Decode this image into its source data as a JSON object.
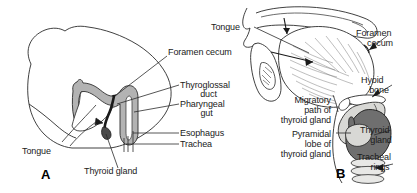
{
  "figure": {
    "panels": [
      {
        "id": "A",
        "letter": "A",
        "caption": "Sagittal section of embryonic head showing thyroglossal duct",
        "labels": [
          {
            "name": "foramen-cecum",
            "text": "Foramen cecum"
          },
          {
            "name": "thyroglossal-duct-line1",
            "text": "Thyroglossal"
          },
          {
            "name": "thyroglossal-duct-line2",
            "text": "duct"
          },
          {
            "name": "pharyngeal-gut-line1",
            "text": "Pharyngeal"
          },
          {
            "name": "pharyngeal-gut-line2",
            "text": "gut"
          },
          {
            "name": "esophagus",
            "text": "Esophagus"
          },
          {
            "name": "trachea",
            "text": "Trachea"
          },
          {
            "name": "tongue",
            "text": "Tongue"
          },
          {
            "name": "thyroid-gland",
            "text": "Thyroid gland"
          }
        ]
      },
      {
        "id": "B",
        "letter": "B",
        "caption": "Sagittal section of adult head and neck showing migratory path of thyroid gland",
        "labels": [
          {
            "name": "tongue",
            "text": "Tongue"
          },
          {
            "name": "foramen-cecum-line1",
            "text": "Foramen"
          },
          {
            "name": "foramen-cecum-line2",
            "text": "cecum"
          },
          {
            "name": "hyoid-bone-line1",
            "text": "Hyoid"
          },
          {
            "name": "hyoid-bone-line2",
            "text": "bone"
          },
          {
            "name": "migratory-path-line1",
            "text": "Migratory"
          },
          {
            "name": "migratory-path-line2",
            "text": "path of"
          },
          {
            "name": "migratory-path-line3",
            "text": "thyroid gland"
          },
          {
            "name": "pyramidal-lobe-line1",
            "text": "Pyramidal"
          },
          {
            "name": "pyramidal-lobe-line2",
            "text": "lobe of"
          },
          {
            "name": "pyramidal-lobe-line3",
            "text": "thyroid gland"
          },
          {
            "name": "thyroid-gland-line1",
            "text": "Thyroid"
          },
          {
            "name": "thyroid-gland-line2",
            "text": "gland"
          },
          {
            "name": "tracheal-rings-line1",
            "text": "Tracheal"
          },
          {
            "name": "tracheal-rings-line2",
            "text": "rings"
          }
        ]
      }
    ]
  },
  "colors": {
    "background": "#ffffff",
    "ink": "#1a1a1a",
    "outline": "#2b2b2b",
    "duct_fill": "#b3b3b3",
    "cartilage_fill": "#d8d8d5",
    "thyroid_fill": "#6f6f6f",
    "tongue_fill": "#ffffff",
    "leader_line": "#2b2b2b"
  }
}
